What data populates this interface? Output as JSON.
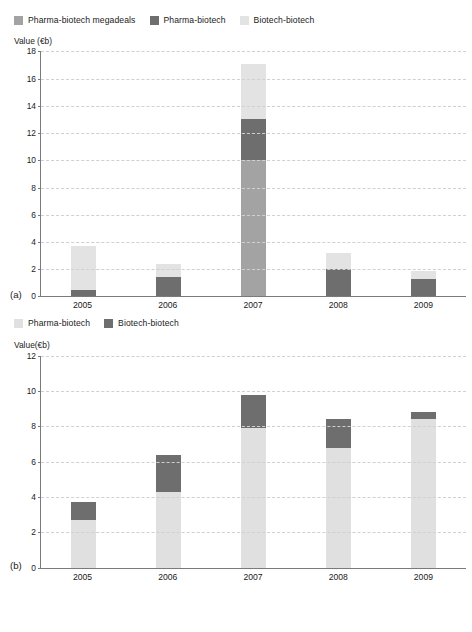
{
  "chart_data": [
    {
      "type": "bar",
      "panel": "(a)",
      "title": "",
      "subtitle": "",
      "ylabel": "Value (€b)",
      "xlabel": "",
      "stacked": true,
      "grid": true,
      "legend_position": "top",
      "categories": [
        "2005",
        "2006",
        "2007",
        "2008",
        "2009"
      ],
      "ylim": [
        0,
        18
      ],
      "yticks": [
        0,
        2,
        4,
        6,
        8,
        10,
        12,
        14,
        16,
        18
      ],
      "series": [
        {
          "name": "Pharma-biotech megadeals",
          "color": "#a3a3a3",
          "values": [
            0,
            0,
            10.0,
            0,
            0
          ]
        },
        {
          "name": "Pharma-biotech",
          "color": "#6e6e6e",
          "values": [
            0.5,
            1.4,
            3.0,
            2.0,
            1.3
          ]
        },
        {
          "name": "Biotech-biotech",
          "color": "#e3e3e3",
          "values": [
            3.2,
            1.0,
            4.1,
            1.2,
            0.6
          ]
        }
      ],
      "totals": [
        3.7,
        2.4,
        17.1,
        3.2,
        1.9
      ]
    },
    {
      "type": "bar",
      "panel": "(b)",
      "title": "",
      "subtitle": "",
      "ylabel": "Value(€b)",
      "xlabel": "",
      "stacked": true,
      "grid": true,
      "legend_position": "top",
      "categories": [
        "2005",
        "2006",
        "2007",
        "2008",
        "2009"
      ],
      "ylim": [
        0,
        12
      ],
      "yticks": [
        0,
        2,
        4,
        6,
        8,
        10,
        12
      ],
      "series": [
        {
          "name": "Pharma-biotech",
          "color": "#e0e0e0",
          "values": [
            2.7,
            4.3,
            7.9,
            6.8,
            8.4
          ]
        },
        {
          "name": "Biotech-biotech",
          "color": "#6e6e6e",
          "values": [
            1.0,
            2.1,
            1.9,
            1.6,
            0.4
          ]
        }
      ],
      "totals": [
        3.7,
        6.4,
        9.8,
        8.4,
        8.8
      ]
    }
  ],
  "chart_a": {
    "panel_tag": "(a)",
    "axis_title": "Value (€b)",
    "legend": [
      {
        "label": "Pharma-biotech megadeals",
        "color": "#a3a3a3"
      },
      {
        "label": "Pharma-biotech",
        "color": "#6e6e6e"
      },
      {
        "label": "Biotech-biotech",
        "color": "#e3e3e3"
      }
    ],
    "yticks": [
      "18",
      "16",
      "14",
      "12",
      "10",
      "8",
      "6",
      "4",
      "2",
      "0"
    ],
    "xlabels": [
      "2005",
      "2006",
      "2007",
      "2008",
      "2009"
    ]
  },
  "chart_b": {
    "panel_tag": "(b)",
    "axis_title": "Value(€b)",
    "legend": [
      {
        "label": "Pharma-biotech",
        "color": "#e0e0e0"
      },
      {
        "label": "Biotech-biotech",
        "color": "#6e6e6e"
      }
    ],
    "yticks": [
      "12",
      "10",
      "8",
      "6",
      "4",
      "2",
      "0"
    ],
    "xlabels": [
      "2005",
      "2006",
      "2007",
      "2008",
      "2009"
    ]
  }
}
